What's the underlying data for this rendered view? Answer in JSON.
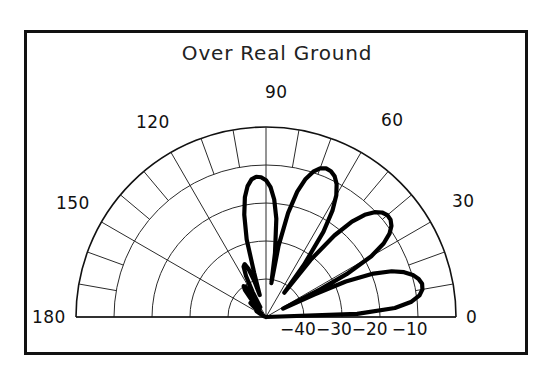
{
  "chart_data": {
    "type": "line",
    "plot_style": "polar-half",
    "title": "Over Real Ground",
    "xlabel": "",
    "ylabel": "",
    "angle_unit": "degrees",
    "angle_range": [
      0,
      180
    ],
    "angle_tick_labels": [
      "0",
      "30",
      "60",
      "90",
      "120",
      "150",
      "180"
    ],
    "angle_tick_values": [
      0,
      30,
      60,
      90,
      120,
      150,
      180
    ],
    "angle_minor_step": 10,
    "radial_unit": "dB",
    "radial_tick_labels": [
      "-40",
      "-30",
      "-20",
      "-10"
    ],
    "radial_tick_values": [
      -40,
      -30,
      -20,
      -10
    ],
    "radial_max_db": 0,
    "radial_min_db": -50,
    "radial_ring_count": 5,
    "grid": true,
    "legend": null,
    "series": [
      {
        "name": "elevation-pattern",
        "description": "Antenna elevation radiation pattern over real ground",
        "points_deg_db": [
          [
            0,
            -50
          ],
          [
            2,
            -26
          ],
          [
            4,
            -16
          ],
          [
            6,
            -11.5
          ],
          [
            8,
            -9.2
          ],
          [
            10,
            -8.2
          ],
          [
            12,
            -8.0
          ],
          [
            14,
            -8.6
          ],
          [
            16,
            -9.8
          ],
          [
            18,
            -11.8
          ],
          [
            20,
            -14.8
          ],
          [
            22,
            -19.5
          ],
          [
            24,
            -27.0
          ],
          [
            25,
            -36.0
          ],
          [
            26,
            -45.0
          ],
          [
            27,
            -34.0
          ],
          [
            28,
            -26.0
          ],
          [
            30,
            -18.0
          ],
          [
            32,
            -13.5
          ],
          [
            34,
            -10.8
          ],
          [
            36,
            -9.2
          ],
          [
            38,
            -8.4
          ],
          [
            40,
            -8.3
          ],
          [
            42,
            -8.9
          ],
          [
            44,
            -10.3
          ],
          [
            46,
            -12.6
          ],
          [
            48,
            -16.2
          ],
          [
            50,
            -22.0
          ],
          [
            52,
            -31.0
          ],
          [
            53,
            -42.0
          ],
          [
            54,
            -33.0
          ],
          [
            56,
            -23.0
          ],
          [
            58,
            -17.0
          ],
          [
            60,
            -13.0
          ],
          [
            62,
            -10.4
          ],
          [
            64,
            -8.8
          ],
          [
            66,
            -8.0
          ],
          [
            68,
            -7.8
          ],
          [
            70,
            -8.4
          ],
          [
            72,
            -9.8
          ],
          [
            74,
            -12.2
          ],
          [
            76,
            -16.0
          ],
          [
            78,
            -22.0
          ],
          [
            80,
            -31.0
          ],
          [
            81,
            -41.0
          ],
          [
            82,
            -33.0
          ],
          [
            84,
            -24.0
          ],
          [
            86,
            -19.0
          ],
          [
            88,
            -15.8
          ],
          [
            90,
            -14.0
          ],
          [
            92,
            -13.2
          ],
          [
            94,
            -13.0
          ],
          [
            96,
            -13.6
          ],
          [
            98,
            -15.2
          ],
          [
            100,
            -18.0
          ],
          [
            102,
            -22.5
          ],
          [
            104,
            -29.0
          ],
          [
            105,
            -38.0
          ],
          [
            106,
            -44.0
          ],
          [
            108,
            -40.0
          ],
          [
            110,
            -36.5
          ],
          [
            112,
            -35.0
          ],
          [
            114,
            -35.5
          ],
          [
            116,
            -38.0
          ],
          [
            118,
            -42.5
          ],
          [
            120,
            -47.0
          ],
          [
            122,
            -43.0
          ],
          [
            124,
            -40.5
          ],
          [
            126,
            -40.0
          ],
          [
            128,
            -41.0
          ],
          [
            130,
            -44.0
          ],
          [
            132,
            -47.5
          ],
          [
            134,
            -46.0
          ],
          [
            136,
            -44.5
          ],
          [
            138,
            -44.5
          ],
          [
            140,
            -46.0
          ],
          [
            142,
            -48.5
          ],
          [
            145,
            -47.5
          ],
          [
            148,
            -47.0
          ],
          [
            150,
            -48.0
          ],
          [
            155,
            -49.0
          ],
          [
            160,
            -49.5
          ],
          [
            170,
            -50.0
          ],
          [
            180,
            -50.0
          ]
        ]
      }
    ]
  },
  "plot_geometry": {
    "center_x": 266,
    "center_y": 317,
    "radius": 190
  },
  "title": "Over Real Ground",
  "angle_labels": [
    {
      "text": "0",
      "left": 466,
      "top": 307
    },
    {
      "text": "30",
      "left": 452,
      "top": 191
    },
    {
      "text": "60",
      "left": 381,
      "top": 110
    },
    {
      "text": "90",
      "left": 265,
      "top": 82
    },
    {
      "text": "120",
      "left": 136,
      "top": 112
    },
    {
      "text": "150",
      "left": 56,
      "top": 193
    },
    {
      "text": "180",
      "left": 32,
      "top": 307
    }
  ],
  "radial_labels": {
    "neg40": "−40",
    "neg30": "−30",
    "neg20": "−20",
    "neg10": "−10"
  },
  "colors": {
    "background": "#ffffff",
    "frame": "#111111",
    "grid": "#2b2b2b",
    "curve": "#000000",
    "text": "#111111"
  }
}
